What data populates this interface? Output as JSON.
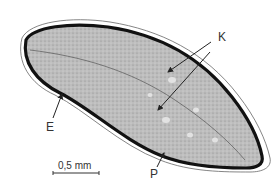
{
  "figure": {
    "labels": {
      "K": "K",
      "E": "E",
      "P": "P"
    },
    "scale_bar": {
      "text": "0,5 mm"
    },
    "colors": {
      "outline": "#111111",
      "fill": "#b8b8b8",
      "outer_line": "#555555",
      "text": "#333333"
    }
  }
}
